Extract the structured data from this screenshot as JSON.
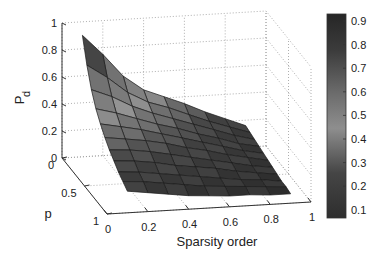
{
  "chart_data": {
    "type": "surface3d",
    "title": "",
    "xlabel": "Sparsity order",
    "ylabel": "p",
    "zlabel": "P",
    "zlabel_sub": "d",
    "x_ticks": [
      "0",
      "0.2",
      "0.4",
      "0.6",
      "0.8",
      "1"
    ],
    "y_ticks": [
      "0",
      "0.5",
      "1"
    ],
    "z_ticks": [
      "0",
      "0.2",
      "0.4",
      "0.6",
      "0.8",
      "1"
    ],
    "xlim": [
      0,
      1
    ],
    "ylim": [
      0,
      1
    ],
    "zlim": [
      0,
      1
    ],
    "grid": true,
    "colorbar": {
      "position": "right",
      "ticks": [
        "0.9",
        "0.8",
        "0.7",
        "0.6",
        "0.5",
        "0.4",
        "0.3",
        "0.2",
        "0.1"
      ],
      "range": [
        0.05,
        0.95
      ],
      "colors": {
        "low": "#2e2e2e",
        "mid": "#8e8e8e",
        "high": "#262626"
      }
    },
    "x": [
      0.1,
      0.2,
      0.3,
      0.4,
      0.5,
      0.6,
      0.7,
      0.8,
      0.9
    ],
    "y": [
      0,
      0.1,
      0.2,
      0.3,
      0.4,
      0.5,
      0.6,
      0.7,
      0.8,
      0.9,
      1.0
    ],
    "z": [
      [
        0.9,
        0.75,
        0.58,
        0.47,
        0.41,
        0.35,
        0.28,
        0.22,
        0.16
      ],
      [
        0.72,
        0.62,
        0.5,
        0.42,
        0.37,
        0.31,
        0.25,
        0.2,
        0.15
      ],
      [
        0.58,
        0.52,
        0.44,
        0.38,
        0.33,
        0.28,
        0.23,
        0.18,
        0.14
      ],
      [
        0.48,
        0.44,
        0.39,
        0.34,
        0.3,
        0.25,
        0.21,
        0.16,
        0.13
      ],
      [
        0.41,
        0.38,
        0.35,
        0.31,
        0.27,
        0.23,
        0.19,
        0.15,
        0.12
      ],
      [
        0.35,
        0.33,
        0.31,
        0.28,
        0.24,
        0.21,
        0.17,
        0.14,
        0.11
      ],
      [
        0.3,
        0.29,
        0.27,
        0.24,
        0.21,
        0.18,
        0.15,
        0.12,
        0.1
      ],
      [
        0.26,
        0.25,
        0.23,
        0.2,
        0.18,
        0.16,
        0.13,
        0.11,
        0.09
      ],
      [
        0.22,
        0.21,
        0.19,
        0.17,
        0.15,
        0.13,
        0.11,
        0.1,
        0.08
      ],
      [
        0.19,
        0.18,
        0.16,
        0.14,
        0.12,
        0.11,
        0.1,
        0.09,
        0.08
      ],
      [
        0.16,
        0.14,
        0.12,
        0.1,
        0.09,
        0.08,
        0.08,
        0.07,
        0.07
      ]
    ]
  }
}
